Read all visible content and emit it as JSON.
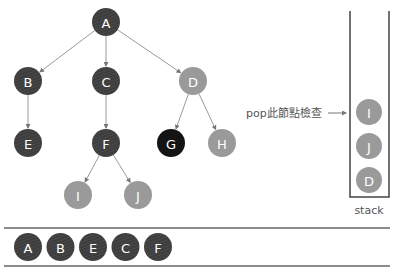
{
  "colors": {
    "visited": "#3d3d3d",
    "in_stack": "#9a9a9a",
    "current": "#141414",
    "edge": "#9a9a9a",
    "stack_wall": "#444444",
    "text": "#555555"
  },
  "tree": {
    "nodes": [
      {
        "id": "A",
        "label": "A",
        "x": 106,
        "y": 22,
        "state": "visited"
      },
      {
        "id": "B",
        "label": "B",
        "x": 28,
        "y": 81,
        "state": "visited"
      },
      {
        "id": "C",
        "label": "C",
        "x": 106,
        "y": 81,
        "state": "visited"
      },
      {
        "id": "D",
        "label": "D",
        "x": 193,
        "y": 81,
        "state": "in_stack"
      },
      {
        "id": "E",
        "label": "E",
        "x": 28,
        "y": 143,
        "state": "visited"
      },
      {
        "id": "F",
        "label": "F",
        "x": 106,
        "y": 143,
        "state": "visited"
      },
      {
        "id": "G",
        "label": "G",
        "x": 171,
        "y": 143,
        "state": "current"
      },
      {
        "id": "H",
        "label": "H",
        "x": 222,
        "y": 143,
        "state": "in_stack"
      },
      {
        "id": "I",
        "label": "I",
        "x": 78,
        "y": 195,
        "state": "in_stack"
      },
      {
        "id": "J",
        "label": "J",
        "x": 138,
        "y": 195,
        "state": "in_stack"
      }
    ],
    "edges": [
      [
        "A",
        "B"
      ],
      [
        "A",
        "C"
      ],
      [
        "A",
        "D"
      ],
      [
        "B",
        "E"
      ],
      [
        "C",
        "F"
      ],
      [
        "D",
        "G"
      ],
      [
        "D",
        "H"
      ],
      [
        "F",
        "I"
      ],
      [
        "F",
        "J"
      ]
    ]
  },
  "pop_annotation": {
    "text": "pop此節點檢查"
  },
  "stack": {
    "label": "stack",
    "items": [
      "I",
      "J",
      "D"
    ]
  },
  "output_queue": {
    "items": [
      "A",
      "B",
      "E",
      "C",
      "F"
    ]
  }
}
